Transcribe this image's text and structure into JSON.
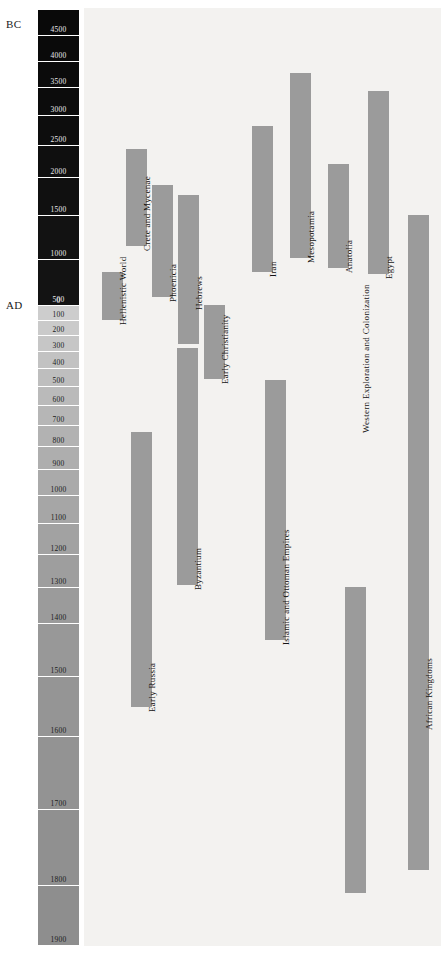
{
  "figure": {
    "type": "timeline-gantt",
    "era_markers": [
      {
        "name": "bc-marker",
        "label": "BC"
      },
      {
        "name": "ad-marker",
        "label": "AD"
      }
    ],
    "background_color": "#f3f2f0",
    "bar_color": "#9b9b9b"
  },
  "time_scale": {
    "orientation": "vertical",
    "direction": "top-is-oldest",
    "bands": [
      {
        "label": "4500",
        "era": "BC",
        "top": 10,
        "height": 26,
        "shade": "#090909"
      },
      {
        "label": "4000",
        "era": "BC",
        "top": 36,
        "height": 26,
        "shade": "#0a0a0a"
      },
      {
        "label": "3500",
        "era": "BC",
        "top": 62,
        "height": 26,
        "shade": "#0b0b0b"
      },
      {
        "label": "3000",
        "era": "BC",
        "top": 88,
        "height": 28,
        "shade": "#0c0c0c"
      },
      {
        "label": "2500",
        "era": "BC",
        "top": 116,
        "height": 30,
        "shade": "#0d0d0d"
      },
      {
        "label": "2000",
        "era": "BC",
        "top": 146,
        "height": 32,
        "shade": "#0f0f0f"
      },
      {
        "label": "1500",
        "era": "BC",
        "top": 178,
        "height": 38,
        "shade": "#101010"
      },
      {
        "label": "1000",
        "era": "BC",
        "top": 216,
        "height": 44,
        "shade": "#121212"
      },
      {
        "label": "500",
        "era": "BC",
        "top": 260,
        "height": 46,
        "shade": "#131313"
      },
      {
        "label": "0",
        "era": "BC",
        "top": 306,
        "height": 0,
        "shade": "#141414"
      },
      {
        "label": "100",
        "era": "AD",
        "top": 306,
        "height": 15,
        "shade": "#cdcdcd"
      },
      {
        "label": "200",
        "era": "AD",
        "top": 321,
        "height": 15,
        "shade": "#cacaca"
      },
      {
        "label": "300",
        "era": "AD",
        "top": 336,
        "height": 16,
        "shade": "#c6c6c6"
      },
      {
        "label": "400",
        "era": "AD",
        "top": 352,
        "height": 17,
        "shade": "#c2c2c2"
      },
      {
        "label": "500",
        "era": "AD",
        "top": 369,
        "height": 18,
        "shade": "#bebebe"
      },
      {
        "label": "600",
        "era": "AD",
        "top": 387,
        "height": 19,
        "shade": "#bababa"
      },
      {
        "label": "700",
        "era": "AD",
        "top": 406,
        "height": 20,
        "shade": "#b6b6b6"
      },
      {
        "label": "800",
        "era": "AD",
        "top": 426,
        "height": 21,
        "shade": "#b2b2b2"
      },
      {
        "label": "900",
        "era": "AD",
        "top": 447,
        "height": 23,
        "shade": "#aeaeae"
      },
      {
        "label": "1000",
        "era": "AD",
        "top": 470,
        "height": 26,
        "shade": "#aaaaaa"
      },
      {
        "label": "1100",
        "era": "AD",
        "top": 496,
        "height": 28,
        "shade": "#a6a6a6"
      },
      {
        "label": "1200",
        "era": "AD",
        "top": 524,
        "height": 31,
        "shade": "#a2a2a2"
      },
      {
        "label": "1300",
        "era": "AD",
        "top": 555,
        "height": 33,
        "shade": "#9e9e9e"
      },
      {
        "label": "1400",
        "era": "AD",
        "top": 588,
        "height": 36,
        "shade": "#9b9b9b"
      },
      {
        "label": "1500",
        "era": "AD",
        "top": 624,
        "height": 53,
        "shade": "#989898"
      },
      {
        "label": "1600",
        "era": "AD",
        "top": 677,
        "height": 60,
        "shade": "#959595"
      },
      {
        "label": "1700",
        "era": "AD",
        "top": 737,
        "height": 73,
        "shade": "#939393"
      },
      {
        "label": "1800",
        "era": "AD",
        "top": 810,
        "height": 76,
        "shade": "#909090"
      },
      {
        "label": "1900",
        "era": "AD",
        "top": 886,
        "height": 60,
        "shade": "#8e8e8e"
      }
    ]
  },
  "chart_data": {
    "type": "bar",
    "title": "",
    "xlabel": "",
    "ylabel": "",
    "orientation": "vertical-timespans",
    "categories": [
      "Hellenistic World",
      "Crete and Mycenae",
      "Phoenicia",
      "Hebrews",
      "Early Christianity",
      "Iran",
      "Mesopotamia",
      "Anatolia",
      "Egypt",
      "Early Russia",
      "Byzantium",
      "Islamic and Ottoman Empires",
      "Western Exploration and Colonization",
      "African Kingdoms"
    ],
    "bars": [
      {
        "label": "Hellenistic World",
        "x": 102,
        "width": 21,
        "top": 272,
        "bottom": 320,
        "label_top": 325
      },
      {
        "label": "Crete and Mycenae",
        "x": 126,
        "width": 21,
        "top": 149,
        "bottom": 246,
        "label_top": 251
      },
      {
        "label": "Phoenicia",
        "x": 152,
        "width": 21,
        "top": 185,
        "bottom": 297,
        "label_top": 302
      },
      {
        "label": "Hebrews",
        "x": 178,
        "width": 21,
        "top": 195,
        "bottom": 344,
        "label_top": 310
      },
      {
        "label": "Early Christianity",
        "x": 204,
        "width": 21,
        "top": 305,
        "bottom": 379,
        "label_top": 384
      },
      {
        "label": "Iran",
        "x": 252,
        "width": 21,
        "top": 126,
        "bottom": 272,
        "label_top": 277
      },
      {
        "label": "Mesopotamia",
        "x": 290,
        "width": 21,
        "top": 73,
        "bottom": 258,
        "label_top": 263
      },
      {
        "label": "Anatolia",
        "x": 328,
        "width": 21,
        "top": 164,
        "bottom": 268,
        "label_top": 273
      },
      {
        "label": "Egypt",
        "x": 368,
        "width": 21,
        "top": 91,
        "bottom": 274,
        "label_top": 279
      },
      {
        "label": "Early Russia",
        "x": 131,
        "width": 21,
        "top": 432,
        "bottom": 707,
        "label_top": 712
      },
      {
        "label": "Byzantium",
        "x": 177,
        "width": 21,
        "top": 348,
        "bottom": 585,
        "label_top": 590
      },
      {
        "label": "Islamic and Ottoman Empires",
        "x": 265,
        "width": 21,
        "top": 380,
        "bottom": 640,
        "label_top": 645
      },
      {
        "label": "Western Exploration and Colonization",
        "x": 345,
        "width": 21,
        "top": 587,
        "bottom": 893,
        "label_top": 433
      },
      {
        "label": "African Kingdoms",
        "x": 408,
        "width": 21,
        "top": 215,
        "bottom": 870,
        "label_top": 730
      }
    ]
  }
}
